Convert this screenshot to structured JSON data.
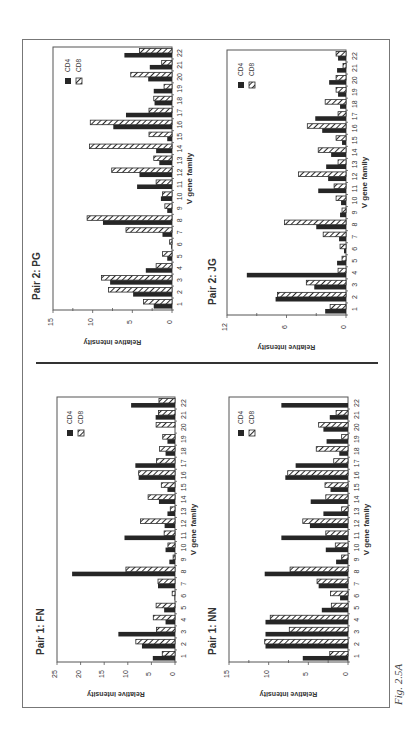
{
  "figure": {
    "caption": "Fig. 2.5A",
    "orientation": "rotated 90° counter-clockwise on page",
    "sections": [
      {
        "label": "Pair 2",
        "panels": [
          "PG",
          "JG"
        ]
      },
      {
        "label": "Pair 1",
        "panels": [
          "FN",
          "NN"
        ]
      }
    ]
  },
  "chart_data": [
    {
      "type": "bar",
      "title": "Pair 2:  PG",
      "xlabel": "V  gene  family",
      "ylabel": "Relative   intensity",
      "ylim": [
        0,
        15
      ],
      "yticks": [
        0,
        5,
        10,
        15
      ],
      "minor_ticks": [
        2.5,
        7.5,
        12.5
      ],
      "grid": false,
      "legend": {
        "entries": [
          "CD4",
          "CD8"
        ],
        "position": "upper-right"
      },
      "categories": [
        "1",
        "2",
        "3",
        "4",
        "5",
        "6",
        "7",
        "8",
        "9",
        "10",
        "11",
        "12",
        "13",
        "14",
        "15",
        "16",
        "17",
        "18",
        "19",
        "20",
        "21",
        "22"
      ],
      "series": [
        {
          "name": "CD4",
          "style": "solid",
          "values": [
            2.3,
            4.9,
            7.8,
            3.3,
            0.6,
            0.1,
            1.2,
            8.7,
            0.6,
            1.4,
            4.4,
            4.1,
            1.6,
            2.0,
            0.6,
            7.4,
            5.8,
            2.2,
            2.3,
            3.0,
            2.8,
            6.0
          ]
        },
        {
          "name": "CD8",
          "style": "hatched",
          "values": [
            3.6,
            8.0,
            8.9,
            2.0,
            1.2,
            0.3,
            5.8,
            10.7,
            0.9,
            1.2,
            2.0,
            7.6,
            2.3,
            10.4,
            2.9,
            10.3,
            2.9,
            2.3,
            1.0,
            5.2,
            1.3,
            4.1
          ]
        }
      ]
    },
    {
      "type": "bar",
      "title": "Pair 2:  JG",
      "xlabel": "V  gene  family",
      "ylabel": "Relative   intensity",
      "ylim": [
        0,
        12
      ],
      "yticks": [
        0,
        6,
        12
      ],
      "minor_ticks": [
        3,
        9
      ],
      "grid": false,
      "legend": {
        "entries": [
          "CD4",
          "CD8"
        ],
        "position": "upper-right"
      },
      "categories": [
        "1",
        "2",
        "3",
        "4",
        "5",
        "6",
        "7",
        "8",
        "9",
        "10",
        "11",
        "12",
        "13",
        "14",
        "15",
        "16",
        "17",
        "18",
        "19",
        "20",
        "21",
        "22"
      ],
      "series": [
        {
          "name": "CD4",
          "style": "solid",
          "values": [
            2.1,
            7.1,
            3.2,
            10.0,
            0.9,
            0.2,
            0.7,
            3.0,
            0.6,
            0.5,
            2.8,
            1.8,
            2.0,
            1.5,
            0.4,
            2.4,
            3.1,
            0.6,
            0.8,
            1.7,
            0.9,
            0.8
          ]
        },
        {
          "name": "CD8",
          "style": "hatched",
          "values": [
            1.6,
            6.9,
            4.0,
            0.8,
            0.4,
            0.6,
            2.3,
            6.2,
            0.4,
            1.0,
            1.2,
            4.8,
            0.8,
            2.8,
            1.0,
            3.9,
            0.8,
            2.1,
            1.0,
            1.0,
            0.3,
            1.0
          ]
        }
      ]
    },
    {
      "type": "bar",
      "title": "Pair 1:  FN",
      "xlabel": "V  gene  family",
      "ylabel": "Relative   intensity",
      "ylim": [
        0,
        25
      ],
      "yticks": [
        0,
        5,
        10,
        15,
        20,
        25
      ],
      "minor_ticks": [],
      "grid": false,
      "legend": {
        "entries": [
          "CD4",
          "CD8"
        ],
        "position": "upper-right"
      },
      "categories": [
        "1",
        "2",
        "3",
        "4",
        "5",
        "6",
        "7",
        "8",
        "9",
        "10",
        "11",
        "12",
        "13",
        "14",
        "15",
        "16",
        "17",
        "18",
        "19",
        "20",
        "21",
        "22"
      ],
      "series": [
        {
          "name": "CD4",
          "style": "solid",
          "values": [
            4.7,
            7.0,
            12.0,
            2.0,
            2.3,
            0.1,
            3.6,
            21.8,
            1.2,
            2.0,
            10.7,
            2.2,
            1.6,
            3.4,
            1.6,
            7.7,
            8.4,
            2.0,
            1.6,
            0.0,
            4.1,
            9.3
          ]
        },
        {
          "name": "CD8",
          "style": "hatched",
          "values": [
            2.7,
            8.3,
            3.9,
            4.6,
            4.0,
            0.6,
            3.6,
            10.4,
            0.4,
            1.5,
            2.3,
            7.3,
            1.0,
            5.7,
            2.9,
            7.7,
            3.9,
            3.3,
            2.6,
            4.0,
            3.5,
            3.4
          ]
        }
      ]
    },
    {
      "type": "bar",
      "title": "Pair 1:  NN",
      "xlabel": "V  gene  family",
      "ylabel": "Relative   intensity",
      "ylim": [
        0,
        15
      ],
      "yticks": [
        0,
        5,
        10,
        15
      ],
      "minor_ticks": [
        2.5,
        7.5,
        12.5
      ],
      "grid": false,
      "legend": {
        "entries": [
          "CD4",
          "CD8"
        ],
        "position": "upper-right"
      },
      "categories": [
        "1",
        "2",
        "3",
        "4",
        "5",
        "6",
        "7",
        "8",
        "9",
        "10",
        "11",
        "12",
        "13",
        "14",
        "15",
        "16",
        "17",
        "18",
        "19",
        "20",
        "21",
        "22"
      ],
      "series": [
        {
          "name": "CD4",
          "style": "solid",
          "values": [
            5.7,
            10.4,
            10.4,
            10.4,
            3.3,
            1.0,
            3.7,
            10.5,
            1.5,
            2.8,
            8.4,
            4.8,
            3.1,
            4.7,
            2.2,
            7.9,
            6.6,
            1.1,
            2.7,
            3.1,
            2.3,
            8.4
          ]
        },
        {
          "name": "CD8",
          "style": "hatched",
          "values": [
            2.3,
            10.5,
            7.4,
            9.8,
            2.1,
            2.2,
            3.9,
            7.3,
            0.8,
            1.6,
            2.8,
            5.7,
            0.8,
            2.8,
            2.9,
            7.6,
            1.8,
            4.0,
            0.8,
            3.7,
            1.5,
            0.0
          ]
        }
      ]
    }
  ],
  "layout": {
    "panels": [
      {
        "id": "PG",
        "axis_zero_x": 172,
        "axis_max_x": 53,
        "cat_top_y": 47,
        "cat_bottom_y": 310,
        "title_x": 40,
        "title_y": 300,
        "ylabel_x": 145,
        "legend_x": 65,
        "legend_y": 58,
        "ticklabel_x": 181,
        "catlabel_x": 182
      },
      {
        "id": "JG",
        "axis_zero_x": 346,
        "axis_max_x": 227,
        "cat_top_y": 50,
        "cat_bottom_y": 315,
        "title_x": 216,
        "title_y": 305,
        "ylabel_x": 318,
        "legend_x": 238,
        "legend_y": 62,
        "ticklabel_x": 355,
        "catlabel_x": 357
      },
      {
        "id": "FN",
        "axis_zero_x": 175,
        "axis_max_x": 57,
        "cat_top_y": 397,
        "cat_bottom_y": 662,
        "title_x": 44,
        "title_y": 655,
        "ylabel_x": 150,
        "legend_x": 67,
        "legend_y": 410,
        "ticklabel_x": 184,
        "catlabel_x": 186
      },
      {
        "id": "NN",
        "axis_zero_x": 348,
        "axis_max_x": 229,
        "cat_top_y": 397,
        "cat_bottom_y": 662,
        "title_x": 216,
        "title_y": 655,
        "ylabel_x": 322,
        "legend_x": 238,
        "legend_y": 410,
        "ticklabel_x": 357,
        "catlabel_x": 359
      }
    ]
  }
}
